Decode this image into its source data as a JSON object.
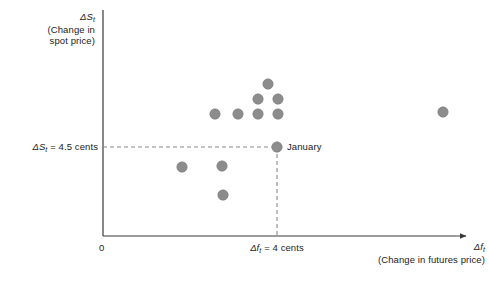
{
  "figure": {
    "background_color": "#ffffff",
    "axis_color": "#3a3a3a",
    "point_color": "#8c8c8c",
    "point_stroke_color": "#7a7a7a",
    "dash_color": "#8a8a8a",
    "text_color": "#1c1c1c"
  },
  "axes": {
    "y_title_symbol": "ΔS",
    "y_title_symbol_sub": "t",
    "y_title_line1": "(Change in",
    "y_title_line2": "spot price)",
    "x_title_symbol": "Δf",
    "x_title_symbol_sub": "t",
    "x_title_line1": "(Change in futures price)",
    "origin_label": "0",
    "y_tick_label_symbol": "ΔS",
    "y_tick_label_sub": "t",
    "y_tick_label_rest": " = 4.5 cents",
    "x_tick_label_symbol": "Δf",
    "x_tick_label_sub": "t",
    "x_tick_label_rest": " = 4 cents"
  },
  "annotations": {
    "january_label": "January"
  },
  "chart_data": {
    "type": "scatter",
    "title": "",
    "xlabel": "Δf_t (Change in futures price)",
    "ylabel": "ΔS_t (Change in spot price)",
    "grid": false,
    "legend": false,
    "xlim": [
      0,
      10
    ],
    "ylim": [
      0,
      10
    ],
    "reference_lines": [
      {
        "name": "spot-price-reference",
        "orientation": "horizontal",
        "value": 4.5,
        "label": "ΔS_t = 4.5 cents",
        "style": "dashed"
      },
      {
        "name": "futures-price-reference",
        "orientation": "vertical",
        "value": 4.0,
        "label": "Δf_t = 4 cents",
        "style": "dashed"
      }
    ],
    "highlight_point": {
      "label": "January",
      "x": 4.0,
      "y": 4.5,
      "px": 277,
      "py": 147
    },
    "points_px": [
      {
        "px": 215,
        "py": 114
      },
      {
        "px": 238,
        "py": 114
      },
      {
        "px": 258,
        "py": 114
      },
      {
        "px": 278,
        "py": 114
      },
      {
        "px": 258,
        "py": 99
      },
      {
        "px": 278,
        "py": 99
      },
      {
        "px": 268,
        "py": 84
      },
      {
        "px": 443,
        "py": 112
      },
      {
        "px": 277,
        "py": 147
      },
      {
        "px": 182,
        "py": 167
      },
      {
        "px": 222,
        "py": 166
      },
      {
        "px": 223,
        "py": 195
      }
    ],
    "points": [
      {
        "x": 2.9,
        "y": 6.1
      },
      {
        "x": 3.5,
        "y": 6.1
      },
      {
        "x": 4.0,
        "y": 6.1
      },
      {
        "x": 4.5,
        "y": 6.1
      },
      {
        "x": 4.0,
        "y": 6.5
      },
      {
        "x": 4.5,
        "y": 6.5
      },
      {
        "x": 4.3,
        "y": 6.9
      },
      {
        "x": 9.3,
        "y": 6.2
      },
      {
        "x": 4.0,
        "y": 4.5
      },
      {
        "x": 2.1,
        "y": 3.9
      },
      {
        "x": 3.2,
        "y": 3.9
      },
      {
        "x": 3.2,
        "y": 3.1
      }
    ]
  }
}
